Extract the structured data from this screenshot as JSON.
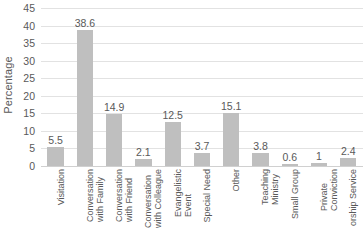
{
  "chart_data": {
    "type": "bar",
    "title": "",
    "xlabel": "",
    "ylabel": "Percentage",
    "ylim": [
      0,
      45
    ],
    "ytick_step": 5,
    "yticks": [
      "45",
      "40",
      "35",
      "30",
      "25",
      "20",
      "15",
      "10",
      "5",
      "0"
    ],
    "grid": true,
    "legend": "none",
    "bar_color": "#bfbfbf",
    "categories": [
      "Visitation",
      "Conversation with Family",
      "Conversation with Friend",
      "Conversation with Colleague",
      "Evangelistic Event",
      "Special Need",
      "Other",
      "Teaching Ministry",
      "Small Group",
      "Private Conviction",
      "Worship Service"
    ],
    "category_lines": [
      [
        "Visitation",
        ""
      ],
      [
        "Conversation",
        "with Family"
      ],
      [
        "Conversation",
        "with Friend"
      ],
      [
        "Conversation",
        "with Colleague"
      ],
      [
        "Evangelistic",
        "Event"
      ],
      [
        "Special Need",
        ""
      ],
      [
        "Other",
        ""
      ],
      [
        "Teaching",
        "Ministry"
      ],
      [
        "Small Group",
        ""
      ],
      [
        "Private",
        "Conviction"
      ],
      [
        "orship Service",
        ""
      ]
    ],
    "values": [
      5.5,
      38.6,
      14.9,
      2.1,
      12.5,
      3.7,
      15.1,
      3.8,
      0.6,
      1,
      2.4
    ],
    "value_labels": [
      "5.5",
      "38.6",
      "14.9",
      "2.1",
      "12.5",
      "3.7",
      "15.1",
      "3.8",
      "0.6",
      "1",
      "2.4"
    ]
  }
}
